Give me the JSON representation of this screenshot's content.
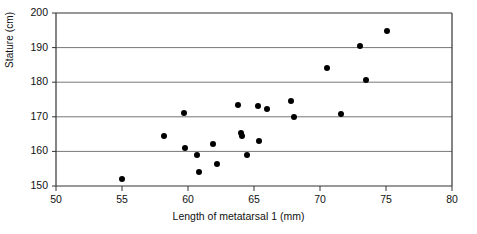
{
  "chart_data": {
    "type": "scatter",
    "title": "",
    "xlabel": "Length of metatarsal 1 (mm)",
    "ylabel": "Stature (cm)",
    "xlim": [
      50,
      80
    ],
    "ylim": [
      150,
      200
    ],
    "xticks": [
      50,
      55,
      60,
      65,
      70,
      75,
      80
    ],
    "yticks": [
      150,
      160,
      170,
      180,
      190,
      200
    ],
    "xtick_labels": [
      "50",
      "55",
      "60",
      "65",
      "70",
      "75",
      "80"
    ],
    "ytick_labels": [
      "150",
      "160",
      "170",
      "180",
      "190",
      "200"
    ],
    "grid": "horizontal",
    "legend": null,
    "marker": "filled-circle",
    "marker_color": "#000000",
    "points": [
      {
        "x": 55.0,
        "y": 152.0
      },
      {
        "x": 58.2,
        "y": 164.5
      },
      {
        "x": 59.7,
        "y": 171.2
      },
      {
        "x": 59.8,
        "y": 161.0
      },
      {
        "x": 60.7,
        "y": 159.0
      },
      {
        "x": 60.8,
        "y": 154.0
      },
      {
        "x": 61.9,
        "y": 162.0
      },
      {
        "x": 62.2,
        "y": 156.3
      },
      {
        "x": 63.8,
        "y": 173.5
      },
      {
        "x": 64.0,
        "y": 165.3
      },
      {
        "x": 64.1,
        "y": 164.5
      },
      {
        "x": 64.5,
        "y": 159.0
      },
      {
        "x": 65.3,
        "y": 173.2
      },
      {
        "x": 65.4,
        "y": 163.1
      },
      {
        "x": 66.0,
        "y": 172.2
      },
      {
        "x": 67.8,
        "y": 174.5
      },
      {
        "x": 68.0,
        "y": 170.0
      },
      {
        "x": 70.5,
        "y": 184.0
      },
      {
        "x": 71.6,
        "y": 170.8
      },
      {
        "x": 73.0,
        "y": 190.5
      },
      {
        "x": 73.5,
        "y": 180.7
      },
      {
        "x": 75.1,
        "y": 194.8
      }
    ]
  },
  "axes": {
    "frame_color": "#333333",
    "grid_color": "#777777"
  }
}
